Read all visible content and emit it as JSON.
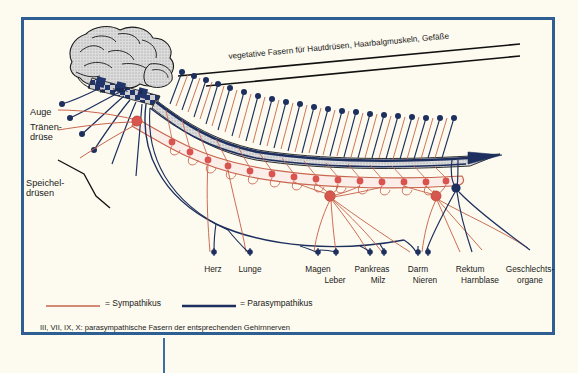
{
  "figure": {
    "banner": "vegetative Fasern für Hautdrüsen, Haarbalgmuskeln, Gefäße",
    "footnote": "III, VII, IX, X: parasympathische Fasern der entsprechenden Gehirnnerven"
  },
  "colors": {
    "frame": "#2e5f92",
    "background": "#fdfbef",
    "sympathetic": "#d9534f",
    "sympathetic_line": "#c9654e",
    "parasympathetic": "#1d2f5e",
    "brain_fill": "#d8d8d8",
    "cord_fill": "#cfcfcf",
    "text": "#1a1a1a"
  },
  "cranial_nerves": [
    {
      "label": "III",
      "x": 100,
      "y": 88
    },
    {
      "label": "VII/IX",
      "x": 113,
      "y": 87
    },
    {
      "label": "X",
      "x": 139,
      "y": 89
    }
  ],
  "side_labels": [
    {
      "label": "Auge",
      "x": 30,
      "y": 107
    },
    {
      "label": "Tränen-",
      "x": 30,
      "y": 122
    },
    {
      "label": "drüse",
      "x": 30,
      "y": 132
    },
    {
      "label": "Speichel-",
      "x": 26,
      "y": 178
    },
    {
      "label": "drüsen",
      "x": 26,
      "y": 188
    }
  ],
  "organs": [
    {
      "label": "Herz",
      "x": 213,
      "y": 265
    },
    {
      "label": "Lunge",
      "x": 250,
      "y": 265
    },
    {
      "label": "Magen",
      "x": 318,
      "y": 265
    },
    {
      "label": "Leber",
      "x": 335,
      "y": 276
    },
    {
      "label": "Pankreas",
      "x": 372,
      "y": 265
    },
    {
      "label": "Milz",
      "x": 378,
      "y": 276
    },
    {
      "label": "Darm",
      "x": 418,
      "y": 265
    },
    {
      "label": "Nieren",
      "x": 425,
      "y": 276
    },
    {
      "label": "Rektum",
      "x": 470,
      "y": 265
    },
    {
      "label": "Harnblase",
      "x": 480,
      "y": 276
    },
    {
      "label": "Geschlechts-",
      "x": 530,
      "y": 265
    },
    {
      "label": "organe",
      "x": 530,
      "y": 276
    }
  ],
  "legend": {
    "items": [
      {
        "label": "= Sympathikus",
        "color": "#c9654e",
        "x": 105,
        "y": 303
      },
      {
        "label": "= Parasympathikus",
        "color": "#1d2f5e",
        "x": 240,
        "y": 303
      }
    ]
  }
}
